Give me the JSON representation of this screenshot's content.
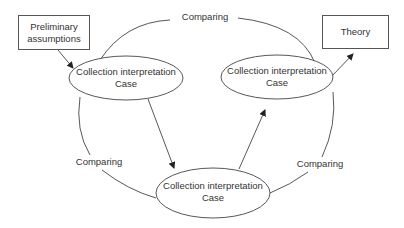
{
  "diagram": {
    "type": "cyclic process diagram",
    "nodes": {
      "preliminary": {
        "line1": "Preliminary",
        "line2": "assumptions",
        "shape": "rectangle"
      },
      "theory": {
        "label": "Theory",
        "shape": "rectangle"
      },
      "case_left": {
        "line1": "Collection interpretation",
        "line2": "Case",
        "shape": "ellipse"
      },
      "case_right": {
        "line1": "Collection interpretation",
        "line2": "Case",
        "shape": "ellipse"
      },
      "case_bottom": {
        "line1": "Collection interpretation",
        "line2": "Case",
        "shape": "ellipse"
      }
    },
    "arc_labels": {
      "top": "Comparing",
      "left": "Comparing",
      "right": "Comparing"
    },
    "edges": [
      {
        "from": "preliminary",
        "to": "case_left",
        "arrow": true
      },
      {
        "from": "case_left",
        "to": "case_bottom",
        "arrow": true
      },
      {
        "from": "case_bottom",
        "to": "case_right",
        "arrow": true
      },
      {
        "from": "case_right",
        "to": "theory",
        "arrow": true
      },
      {
        "from": "case_left",
        "to": "case_right",
        "label": "Comparing",
        "arrow": false
      },
      {
        "from": "case_left",
        "to": "case_bottom",
        "label": "Comparing",
        "arrow": false
      },
      {
        "from": "case_right",
        "to": "case_bottom",
        "label": "Comparing",
        "arrow": false
      }
    ],
    "colors": {
      "stroke": "#444444",
      "text": "#333333",
      "background": "#ffffff"
    }
  }
}
